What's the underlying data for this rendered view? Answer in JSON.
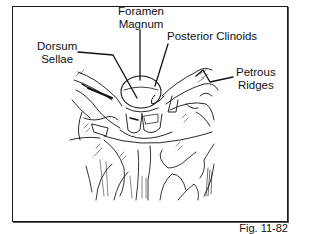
{
  "figure": {
    "caption": "Fig. 11-82"
  },
  "labels": {
    "foramen_magnum": {
      "line1": "Foramen",
      "line2": "Magnum"
    },
    "posterior_clinoids": {
      "line1": "Posterior Clinoids"
    },
    "dorsum_sellae": {
      "line1": "Dorsum",
      "line2": "Sellae"
    },
    "petrous_ridges": {
      "line1": "Petrous",
      "line2": "Ridges"
    }
  },
  "colors": {
    "ink": "#111111",
    "background": "#ffffff"
  }
}
